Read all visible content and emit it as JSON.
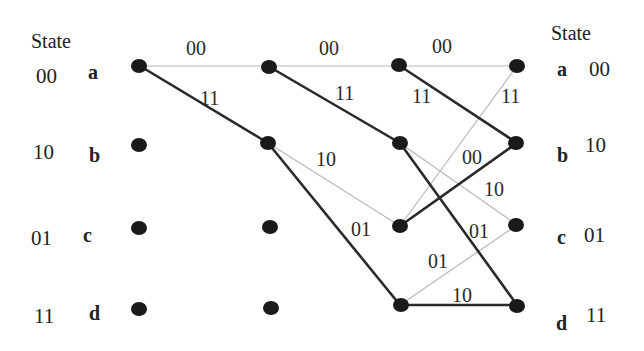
{
  "diagram": {
    "type": "trellis",
    "left_header": "State",
    "right_header": "State",
    "states": [
      {
        "id": "a",
        "letter": "a",
        "code": "00"
      },
      {
        "id": "b",
        "letter": "b",
        "code": "10"
      },
      {
        "id": "c",
        "letter": "c",
        "code": "01"
      },
      {
        "id": "d",
        "letter": "d",
        "code": "11"
      }
    ],
    "columns": 4,
    "edges": [
      {
        "from_col": 0,
        "from": "a",
        "to": "a",
        "label": "00",
        "style": "thin"
      },
      {
        "from_col": 0,
        "from": "a",
        "to": "b",
        "label": "11",
        "style": "thick"
      },
      {
        "from_col": 1,
        "from": "a",
        "to": "a",
        "label": "00",
        "style": "thin"
      },
      {
        "from_col": 1,
        "from": "a",
        "to": "b",
        "label": "11",
        "style": "thick"
      },
      {
        "from_col": 1,
        "from": "b",
        "to": "c",
        "label": "10",
        "style": "thin"
      },
      {
        "from_col": 1,
        "from": "b",
        "to": "d",
        "label": "01",
        "style": "thick"
      },
      {
        "from_col": 2,
        "from": "a",
        "to": "a",
        "label": "00",
        "style": "thin"
      },
      {
        "from_col": 2,
        "from": "a",
        "to": "b",
        "label": "11",
        "style": "thick"
      },
      {
        "from_col": 2,
        "from": "b",
        "to": "c",
        "label": "10",
        "style": "thin"
      },
      {
        "from_col": 2,
        "from": "b",
        "to": "d",
        "label": "01",
        "style": "thick"
      },
      {
        "from_col": 2,
        "from": "c",
        "to": "a",
        "label": "11",
        "style": "thin"
      },
      {
        "from_col": 2,
        "from": "c",
        "to": "b",
        "label": "00",
        "style": "thick"
      },
      {
        "from_col": 2,
        "from": "d",
        "to": "c",
        "label": "01",
        "style": "thin"
      },
      {
        "from_col": 2,
        "from": "d",
        "to": "d",
        "label": "10",
        "style": "thick"
      }
    ],
    "labels": {
      "e0_aa": "00",
      "e0_ab": "11",
      "e1_aa": "00",
      "e1_ab": "11",
      "e1_bc": "10",
      "e1_bd": "01",
      "e2_aa": "00",
      "e2_ab": "11",
      "e2_bc": "10",
      "e2_bd": "01",
      "e2_ca": "11",
      "e2_cb": "00",
      "e2_dc": "01",
      "e2_dd": "10"
    },
    "colors": {
      "thick_edge": "#2a2a2a",
      "thin_edge": "#b8b8b8",
      "node": "#1a1a1a",
      "text": "#222222"
    }
  }
}
